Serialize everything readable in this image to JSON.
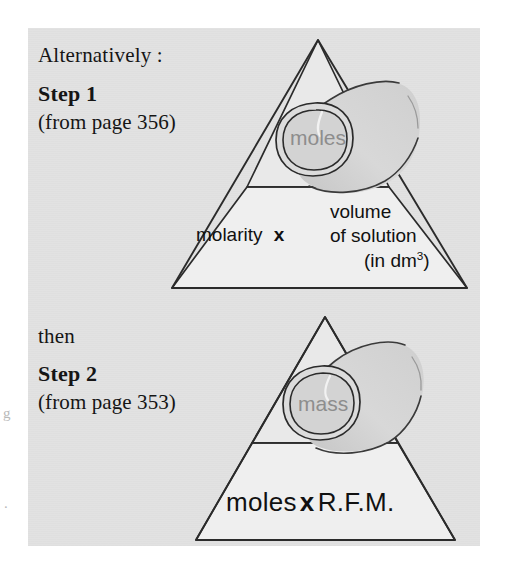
{
  "page": {
    "background_color": "#ffffff",
    "panel_color": "#e2e2e2"
  },
  "colors": {
    "ink": "#151515",
    "tube_fill": "#d2d2d2",
    "tube_fill_light": "#dcdcdc",
    "tube_word": "#8d8d8d",
    "triangle_fill_top": "#e8e8e8",
    "triangle_fill_bottom": "#efefef",
    "stroke": "#2b2b2b"
  },
  "left_column": {
    "alternatively_label": "Alternatively :",
    "step1_title": "Step 1",
    "step1_page_ref": "(from page 356)",
    "then_label": "then",
    "step2_title": "Step 2",
    "step2_page_ref": "(from page 353)"
  },
  "step1_triangle": {
    "tube_word": "moles",
    "bottom_left_label": "molarity",
    "multiply_symbol": "x",
    "bottom_right_line1": "volume",
    "bottom_right_line2": "of solution",
    "bottom_right_line3_prefix": "(in dm",
    "bottom_right_line3_exponent": "3",
    "bottom_right_line3_suffix": ")"
  },
  "step2_triangle": {
    "tube_word": "mass",
    "bottom_left_label": "moles",
    "multiply_symbol": "x",
    "bottom_right_label": "R.F.M."
  },
  "scan_artifacts": {
    "left_edge_mark_1": "g",
    "left_edge_mark_2": "."
  }
}
